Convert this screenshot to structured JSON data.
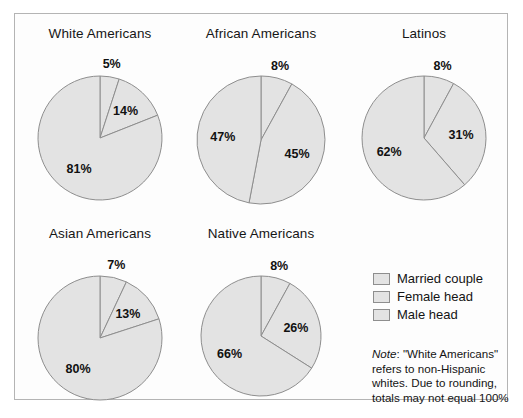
{
  "figure": {
    "background_color": "#ffffff",
    "frame_color": "#b4b4b4",
    "slice_fill": "#e3e3e3",
    "slice_stroke": "#8e8e8e"
  },
  "legend": {
    "items": [
      {
        "label": "Married couple",
        "color": "#e3e3e3"
      },
      {
        "label": "Female head",
        "color": "#e3e3e3"
      },
      {
        "label": "Male head",
        "color": "#e3e3e3"
      }
    ]
  },
  "note": {
    "lead": "Note",
    "body": ": \"White Americans\" refers to non-Hispanic whites. Due to rounding, totals may not equal 100%"
  },
  "chart_data": {
    "type": "pie",
    "title": "",
    "legend_position": "bottom-right",
    "categories": [
      "Male head",
      "Female head",
      "Married couple"
    ],
    "value_unit": "%",
    "note": "Note: \"White Americans\" refers to non-Hispanic whites. Due to rounding, totals may not equal 100%",
    "charts": [
      {
        "title": "White Americans",
        "slices": [
          {
            "label": "Male head",
            "value": 5,
            "text": "5%"
          },
          {
            "label": "Female head",
            "value": 14,
            "text": "14%"
          },
          {
            "label": "Married couple",
            "value": 81,
            "text": "81%"
          }
        ]
      },
      {
        "title": "African Americans",
        "slices": [
          {
            "label": "Male head",
            "value": 8,
            "text": "8%"
          },
          {
            "label": "Female head",
            "value": 45,
            "text": "45%"
          },
          {
            "label": "Married couple",
            "value": 47,
            "text": "47%"
          }
        ]
      },
      {
        "title": "Latinos",
        "slices": [
          {
            "label": "Male head",
            "value": 8,
            "text": "8%"
          },
          {
            "label": "Female head",
            "value": 31,
            "text": "31%"
          },
          {
            "label": "Married couple",
            "value": 62,
            "text": "62%"
          }
        ]
      },
      {
        "title": "Asian Americans",
        "slices": [
          {
            "label": "Male head",
            "value": 7,
            "text": "7%"
          },
          {
            "label": "Female head",
            "value": 13,
            "text": "13%"
          },
          {
            "label": "Married couple",
            "value": 80,
            "text": "80%"
          }
        ]
      },
      {
        "title": "Native Americans",
        "slices": [
          {
            "label": "Male head",
            "value": 8,
            "text": "8%"
          },
          {
            "label": "Female head",
            "value": 26,
            "text": "26%"
          },
          {
            "label": "Married couple",
            "value": 66,
            "text": "66%"
          }
        ]
      }
    ]
  }
}
